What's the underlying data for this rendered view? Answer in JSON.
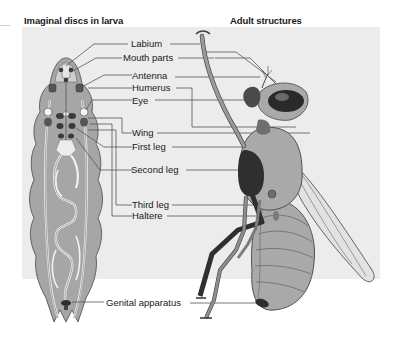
{
  "figure": {
    "headings": {
      "left": "Imaginal discs in larva",
      "right": "Adult structures"
    },
    "labels": [
      {
        "id": "labium",
        "text": "Labium"
      },
      {
        "id": "mouth-parts",
        "text": "Mouth parts"
      },
      {
        "id": "antenna",
        "text": "Antenna"
      },
      {
        "id": "humerus",
        "text": "Humerus"
      },
      {
        "id": "eye",
        "text": "Eye"
      },
      {
        "id": "wing",
        "text": "Wing"
      },
      {
        "id": "first-leg",
        "text": "First leg"
      },
      {
        "id": "second-leg",
        "text": "Second leg"
      },
      {
        "id": "third-leg",
        "text": "Third leg"
      },
      {
        "id": "haltere",
        "text": "Haltere"
      },
      {
        "id": "genital-apparatus",
        "text": "Genital apparatus"
      }
    ],
    "colors": {
      "panel_bg": "#ececec",
      "body_gray": "#a9a9a9",
      "dark_disc": "#3a3a3a",
      "leader_line": "#555555",
      "text": "#1a1a1a"
    }
  }
}
